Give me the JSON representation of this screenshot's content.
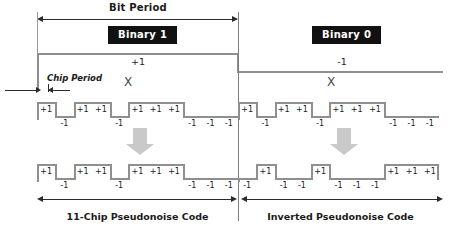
{
  "diagram": {
    "bit_period_label": "Bit Period",
    "chip_period_label": "Chip Period",
    "multiply_symbol": "X"
  },
  "bits": [
    {
      "id": "binary-1",
      "badge": "Binary 1",
      "amplitude_label": "+1",
      "caption": "11-Chip Pseudonoise Code",
      "chips": [
        "+1",
        "-1",
        "+1",
        "+1",
        "-1",
        "+1",
        "+1",
        "+1",
        "-1",
        "-1",
        "-1"
      ],
      "output_chips": [
        "+1",
        "-1",
        "+1",
        "+1",
        "-1",
        "+1",
        "+1",
        "+1",
        "-1",
        "-1",
        "-1"
      ]
    },
    {
      "id": "binary-0",
      "badge": "Binary 0",
      "amplitude_label": "-1",
      "caption": "Inverted Pseudonoise Code",
      "chips": [
        "+1",
        "-1",
        "+1",
        "+1",
        "-1",
        "+1",
        "+1",
        "+1",
        "-1",
        "-1",
        "-1"
      ],
      "output_chips": [
        "-1",
        "+1",
        "-1",
        "-1",
        "+1",
        "-1",
        "-1",
        "-1",
        "+1",
        "+1",
        "+1"
      ]
    }
  ],
  "colors": {
    "waveform": "#8f8f8f",
    "badge_bg": "#111111",
    "badge_text": "#ffffff",
    "arrow_fill": "#c9c9c9",
    "dimension": "#2b2b2b",
    "background": "#ffffff"
  }
}
